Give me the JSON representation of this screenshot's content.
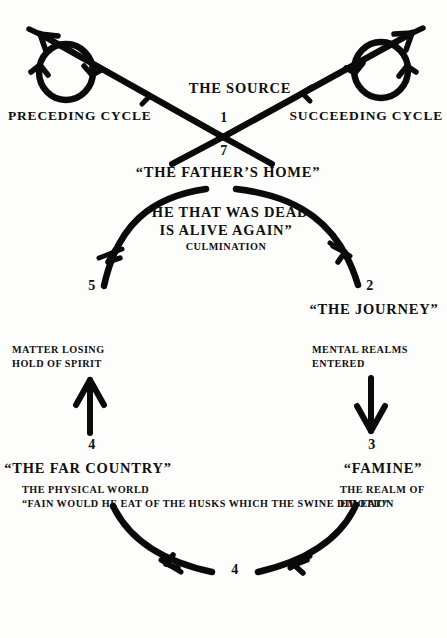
{
  "diagram": {
    "background_color": "#fdfdfc",
    "ink_color": "#0a0a0a",
    "top": {
      "source_label": "THE SOURCE",
      "node_number_upper": "1",
      "node_number_lower": "7",
      "fathers_home_label": "“THE FATHER’S HOME”",
      "preceding_cycle_label": "PRECEDING CYCLE",
      "succeeding_cycle_label": "SUCCEEDING CYCLE"
    },
    "stations": [
      {
        "number": "1",
        "name": "source",
        "title": "THE SOURCE",
        "subtitle": "",
        "position": "top-center-above-cross"
      },
      {
        "number": "7",
        "name": "fathers-home",
        "title": "“THE FATHER’S HOME”",
        "subtitle": "",
        "position": "top-center-below-cross"
      },
      {
        "number": "2",
        "name": "the-journey",
        "title": "“THE JOURNEY”",
        "subtitle_line1": "MENTAL REALMS",
        "subtitle_line2": "ENTERED",
        "position": "upper-right"
      },
      {
        "number": "3",
        "name": "famine",
        "title": "“FAMINE”",
        "subtitle_line1": "THE REALM OF",
        "subtitle_line2": "EMOTION",
        "position": "lower-right"
      },
      {
        "number": "4",
        "name": "the-far-country",
        "title": "“THE FAR COUNTRY”",
        "subtitle_line1": "THE PHYSICAL WORLD",
        "subtitle_line2": "“FAIN WOULD HE EAT OF THE HUSKS WHICH THE SWINE DID EAT”",
        "position": "bottom-center"
      },
      {
        "number": "5",
        "name": "i-will-arise",
        "title": "“I WILL ARISE”",
        "subtitle_line1": "MATTER LOSING",
        "subtitle_line2": "HOLD OF SPIRIT",
        "position": "lower-left"
      },
      {
        "number": "6",
        "name": "he-came-to-his-father",
        "title_line1": "“HE CAME TO",
        "title_line2": "HIS FATHER”",
        "subtitle_line1": "SPIRIT DOMINATES",
        "subtitle_line2": "MATTER",
        "position": "upper-left"
      }
    ],
    "culmination": {
      "quote_line1": "“HE THAT WAS DEAD",
      "quote_line2": "IS ALIVE AGAIN”",
      "caption": "CULMINATION"
    },
    "arrows": [
      {
        "name": "preceding-cycle-line",
        "direction": "up-left",
        "description": "descending straight line entering the cross from upper-left with arrowhead pointing up-left"
      },
      {
        "name": "preceding-cycle-loop",
        "direction": "loop",
        "description": "circular loop with two arrowheads on the preceding cycle line"
      },
      {
        "name": "succeeding-cycle-line",
        "direction": "up-right",
        "description": "ascending straight line leaving the cross to upper-right with arrowhead pointing up-right"
      },
      {
        "name": "succeeding-cycle-loop",
        "direction": "loop",
        "description": "circular loop with two arrowheads on the succeeding cycle line"
      },
      {
        "name": "arc-1-to-2",
        "direction": "clockwise-down-right",
        "description": "arc from the top center curving down to station 2"
      },
      {
        "name": "arrow-2-to-3",
        "direction": "down",
        "description": "vertical arrow pointing down from station 2 to station 3"
      },
      {
        "name": "arc-3-to-4",
        "direction": "down-left",
        "description": "arc from station 3 sweeping down-left to station 4"
      },
      {
        "name": "arc-4-to-5",
        "direction": "up-left",
        "description": "arc from station 4 sweeping up-left to station 5"
      },
      {
        "name": "arrow-5-to-6",
        "direction": "up",
        "description": "vertical arrow pointing up from station 5 to station 6"
      },
      {
        "name": "arc-6-to-7",
        "direction": "up-right",
        "description": "arc from station 6 curving up to the top center"
      }
    ]
  }
}
